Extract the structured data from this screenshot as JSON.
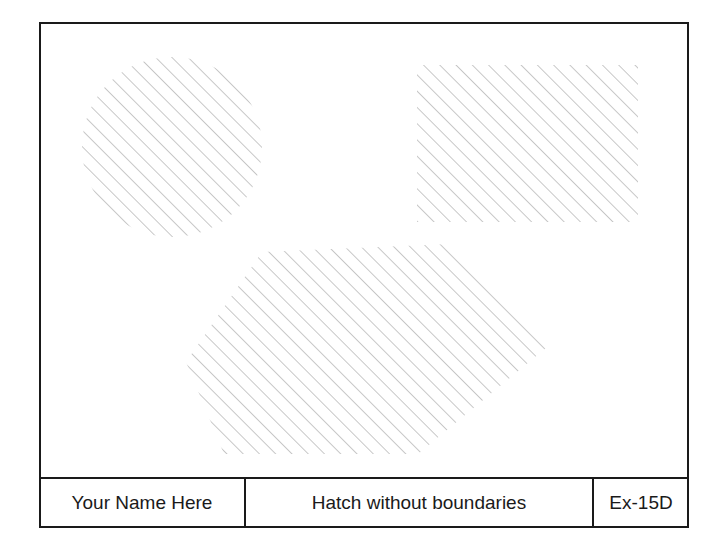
{
  "drawing": {
    "frame": {
      "stroke": "#1a1a1a",
      "hatch_color": "#9a9a9a"
    },
    "shapes": [
      {
        "type": "circle",
        "label": "hatched-circle"
      },
      {
        "type": "rectangle",
        "label": "hatched-rectangle"
      },
      {
        "type": "hexagon",
        "label": "hatched-hexagon"
      }
    ]
  },
  "title_block": {
    "author": "Your Name Here",
    "title": "Hatch without boundaries",
    "exercise_id": "Ex-15D"
  }
}
